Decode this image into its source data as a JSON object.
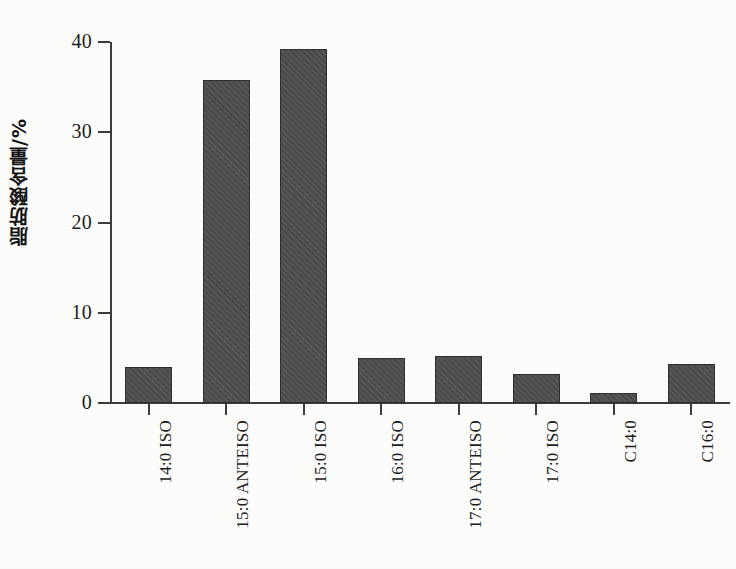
{
  "chart_data": {
    "type": "bar",
    "title": "",
    "subtitle": "",
    "xlabel": "",
    "ylabel": "脂肪酸含量/%",
    "ylim": [
      0,
      40
    ],
    "y_ticks": [
      0,
      10,
      20,
      30,
      40
    ],
    "y_tick_labels": [
      "0",
      "10",
      "20",
      "30",
      "40"
    ],
    "grid": false,
    "legend": false,
    "legend_position": "none",
    "bar_color": "#4d4d4d",
    "axis_color": "#3b3b3b",
    "background_color": "#fdfdfc",
    "categories": [
      "14:0 ISO",
      "15:0 ANTEISO",
      "15:0 ISO",
      "16:0 ISO",
      "17:0 ANTEISO",
      "17:0 ISO",
      "C14:0",
      "C16:0"
    ],
    "values": [
      4.0,
      35.8,
      39.2,
      5.0,
      5.2,
      3.2,
      1.1,
      4.3
    ]
  },
  "axis": {
    "y_title": "脂肪酸含量/%"
  }
}
